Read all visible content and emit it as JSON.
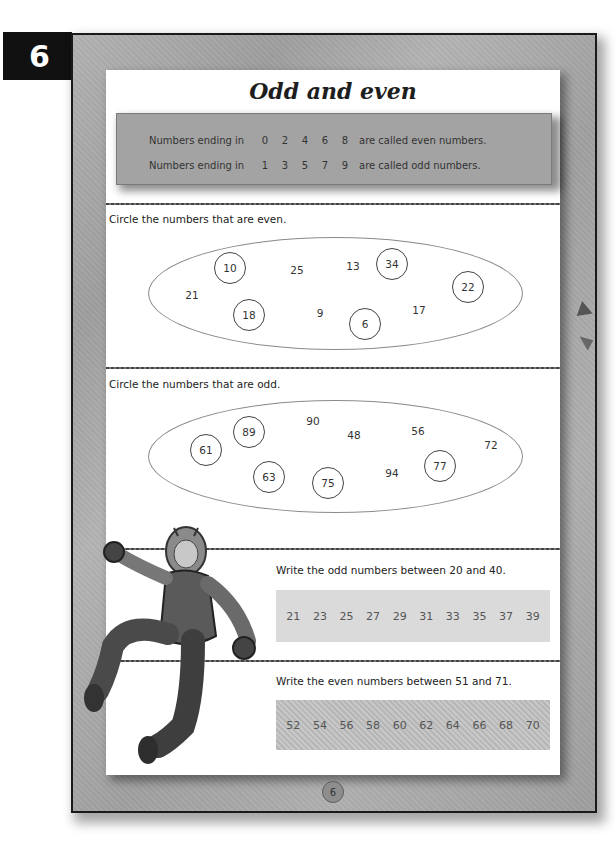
{
  "unit_tab": {
    "number": "6"
  },
  "title": "Odd and even",
  "info_box": {
    "rows": [
      {
        "lead": "Numbers ending in",
        "digits": [
          "0",
          "2",
          "4",
          "6",
          "8"
        ],
        "tail": "are called even numbers."
      },
      {
        "lead": "Numbers ending in",
        "digits": [
          "1",
          "3",
          "5",
          "7",
          "9"
        ],
        "tail": "are called odd numbers."
      }
    ]
  },
  "even_section": {
    "instruction": "Circle the numbers that are even.",
    "numbers": [
      {
        "value": "10",
        "circled": true,
        "x": 124,
        "y": 198
      },
      {
        "value": "25",
        "circled": false,
        "x": 191,
        "y": 200
      },
      {
        "value": "13",
        "circled": false,
        "x": 247,
        "y": 196
      },
      {
        "value": "34",
        "circled": true,
        "x": 286,
        "y": 194
      },
      {
        "value": "22",
        "circled": true,
        "x": 362,
        "y": 217
      },
      {
        "value": "21",
        "circled": false,
        "x": 86,
        "y": 225
      },
      {
        "value": "18",
        "circled": true,
        "x": 143,
        "y": 245
      },
      {
        "value": "9",
        "circled": false,
        "x": 214,
        "y": 243
      },
      {
        "value": "6",
        "circled": true,
        "x": 259,
        "y": 254
      },
      {
        "value": "17",
        "circled": false,
        "x": 313,
        "y": 240
      }
    ]
  },
  "odd_section": {
    "instruction": "Circle the numbers that are odd.",
    "numbers": [
      {
        "value": "90",
        "circled": false,
        "x": 207,
        "y": 351
      },
      {
        "value": "89",
        "circled": true,
        "x": 143,
        "y": 362
      },
      {
        "value": "48",
        "circled": false,
        "x": 248,
        "y": 365
      },
      {
        "value": "56",
        "circled": false,
        "x": 312,
        "y": 361
      },
      {
        "value": "72",
        "circled": false,
        "x": 385,
        "y": 375
      },
      {
        "value": "61",
        "circled": true,
        "x": 100,
        "y": 380
      },
      {
        "value": "63",
        "circled": true,
        "x": 163,
        "y": 407
      },
      {
        "value": "75",
        "circled": true,
        "x": 222,
        "y": 413
      },
      {
        "value": "94",
        "circled": false,
        "x": 286,
        "y": 403
      },
      {
        "value": "77",
        "circled": true,
        "x": 334,
        "y": 396
      }
    ]
  },
  "odd_write": {
    "instruction": "Write the odd numbers between 20 and 40.",
    "answers": [
      "21",
      "23",
      "25",
      "27",
      "29",
      "31",
      "33",
      "35",
      "37",
      "39"
    ]
  },
  "even_write": {
    "instruction": "Write the even numbers between 51 and 71.",
    "answers": [
      "52",
      "54",
      "56",
      "58",
      "60",
      "62",
      "64",
      "66",
      "68",
      "70"
    ]
  },
  "footer": {
    "page_number": "6"
  },
  "illustration": {
    "description": "superhero in armored suit and helmet, leaping"
  },
  "colors": {
    "tab": "#111111",
    "page_background": "#a9a9a9",
    "info_box": "#a3a3a3",
    "answer_light": "#dadada",
    "answer_dark": "#c0c0c0"
  }
}
